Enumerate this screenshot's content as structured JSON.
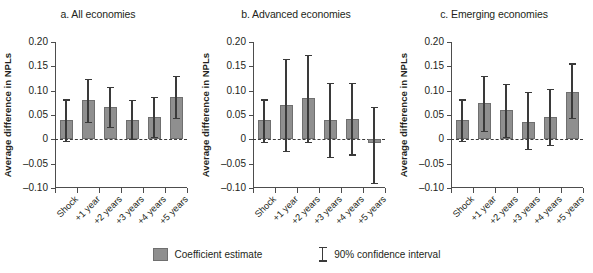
{
  "chart_data": {
    "type": "bar",
    "title": "",
    "xlabel": "",
    "ylabel": "Average difference in NPLs",
    "ylim": [
      -0.1,
      0.2
    ],
    "yticks": [
      0.2,
      0.15,
      0.1,
      0.05,
      0,
      -0.05,
      -0.1
    ],
    "ytick_labels": [
      "0.20",
      "0.15",
      "0.10",
      "0.05",
      "0",
      "–0.05",
      "–0.10"
    ],
    "categories": [
      "Shock",
      "+1 year",
      "+2 years",
      "+3 years",
      "+4 years",
      "+5 years"
    ],
    "grid": false,
    "legend_position": "bottom",
    "legend": [
      "Coefficient estimate",
      "90% confidence interval"
    ],
    "zero_reference_line": 0,
    "panels": [
      {
        "id": "a",
        "title": "a. All economies",
        "values": [
          0.039,
          0.08,
          0.066,
          0.039,
          0.046,
          0.087
        ],
        "ci_low": [
          -0.004,
          0.036,
          0.026,
          0.0,
          0.004,
          0.044
        ],
        "ci_high": [
          0.082,
          0.125,
          0.107,
          0.081,
          0.088,
          0.13
        ]
      },
      {
        "id": "b",
        "title": "b. Advanced economies",
        "values": [
          0.039,
          0.07,
          0.084,
          0.04,
          0.041,
          -0.008
        ],
        "ci_low": [
          -0.005,
          -0.023,
          -0.005,
          -0.037,
          -0.031,
          -0.089
        ],
        "ci_high": [
          0.082,
          0.166,
          0.173,
          0.116,
          0.116,
          0.066
        ]
      },
      {
        "id": "c",
        "title": "c. Emerging economies",
        "values": [
          0.039,
          0.074,
          0.06,
          0.035,
          0.045,
          0.098
        ],
        "ci_low": [
          -0.004,
          0.018,
          0.004,
          -0.019,
          -0.011,
          0.044
        ],
        "ci_high": [
          0.082,
          0.131,
          0.114,
          0.098,
          0.104,
          0.156
        ]
      }
    ],
    "colors": {
      "bar": "#8f8f8f",
      "bar_edge": "#6f6f6f",
      "ci": "#3a3a3a",
      "axis": "#4d4d4d",
      "text": "#231f20",
      "background": "#ffffff"
    }
  },
  "legend": {
    "coefficient_label": "Coefficient estimate",
    "ci_label": "90% confidence interval"
  }
}
